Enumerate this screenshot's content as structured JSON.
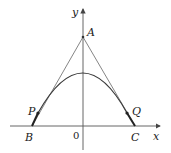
{
  "diagram": {
    "axes": {
      "x_label": "x",
      "y_label": "y",
      "origin_label": "0"
    },
    "points": {
      "A": {
        "label": "A",
        "x": 83,
        "y": 37
      },
      "B": {
        "label": "B",
        "x": 32,
        "y": 126
      },
      "C": {
        "label": "C",
        "x": 135,
        "y": 126
      },
      "P": {
        "label": "P",
        "x": 38,
        "y": 113
      },
      "Q": {
        "label": "Q",
        "x": 127,
        "y": 113
      }
    },
    "curve": {
      "type": "parabola",
      "vertex_x": 83,
      "vertex_y": 73
    },
    "colors": {
      "curve": "#3a3a3a",
      "tangent": "#777777",
      "axis": "#444444",
      "bold_segment": "#222222"
    }
  }
}
